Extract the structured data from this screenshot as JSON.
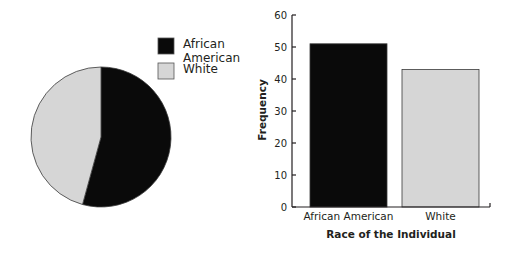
{
  "chart_data": [
    {
      "type": "pie",
      "title": "",
      "labels": [
        "African American",
        "White"
      ],
      "values": [
        51,
        43
      ],
      "colors": [
        "#0a0a0a",
        "#d6d6d6"
      ],
      "start": "top",
      "direction": "clockwise",
      "legend": {
        "placement": "top-right",
        "entries": [
          {
            "label_lines": [
              "African",
              "American"
            ],
            "color": "#0a0a0a"
          },
          {
            "label_lines": [
              "White"
            ],
            "color": "#d6d6d6"
          }
        ]
      }
    },
    {
      "type": "bar",
      "title": "",
      "categories": [
        "African American",
        "White"
      ],
      "values": [
        51,
        43
      ],
      "colors": [
        "#0a0a0a",
        "#d6d6d6"
      ],
      "xlabel": "Race of the Individual",
      "ylabel": "Frequency",
      "ylim": [
        0,
        60
      ],
      "yticks": [
        0,
        10,
        20,
        30,
        40,
        50,
        60
      ],
      "grid": false
    }
  ]
}
